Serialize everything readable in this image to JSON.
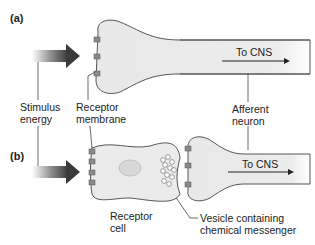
{
  "panels": {
    "a": {
      "label": "(a)"
    },
    "b": {
      "label": "(b)"
    }
  },
  "labels": {
    "to_cns_a": "To CNS",
    "to_cns_b": "To CNS",
    "stimulus_line1": "Stimulus",
    "stimulus_line2": "energy",
    "receptor_membrane_line1": "Receptor",
    "receptor_membrane_line2": "membrane",
    "afferent_line1": "Afferent",
    "afferent_line2": "neuron",
    "receptor_cell_line1": "Receptor",
    "receptor_cell_line2": "cell",
    "vesicle_line1": "Vesicle containing",
    "vesicle_line2": "chemical messenger"
  },
  "colors": {
    "neuron_fill": "#ebebeb",
    "outline": "#555555",
    "receptor": "#8a8a8a",
    "arrow_dark": "#3a3a3a"
  }
}
